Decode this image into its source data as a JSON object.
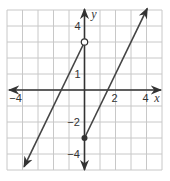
{
  "chart_data": {
    "type": "line",
    "title": "",
    "xlabel": "x",
    "ylabel": "y",
    "xlim": [
      -5,
      5
    ],
    "ylim": [
      -5,
      5
    ],
    "grid": true,
    "x_tick_labels": [
      {
        "value": -4,
        "label": "−4"
      },
      {
        "value": 2,
        "label": "2"
      },
      {
        "value": 4,
        "label": "4"
      }
    ],
    "y_tick_labels": [
      {
        "value": 4,
        "label": "4"
      },
      {
        "value": 1,
        "label": "1"
      },
      {
        "value": -2,
        "label": "−2"
      },
      {
        "value": -4,
        "label": "−4"
      }
    ],
    "series": [
      {
        "name": "left piece",
        "equation": "y = 2x + 3, x < 0",
        "x": [
          -3.9,
          0
        ],
        "y": [
          -4.8,
          3
        ],
        "start": "arrow",
        "end": "open circle at (0, 3)"
      },
      {
        "name": "right piece",
        "equation": "y = 2x - 3, x >= 0",
        "x": [
          0,
          4.05
        ],
        "y": [
          -3,
          5.1
        ],
        "start": "closed dot at (0, -3)",
        "end": "arrow"
      }
    ],
    "colors": {
      "grid": "#c8c8c8",
      "axis": "#333333",
      "line": "#444444"
    }
  }
}
